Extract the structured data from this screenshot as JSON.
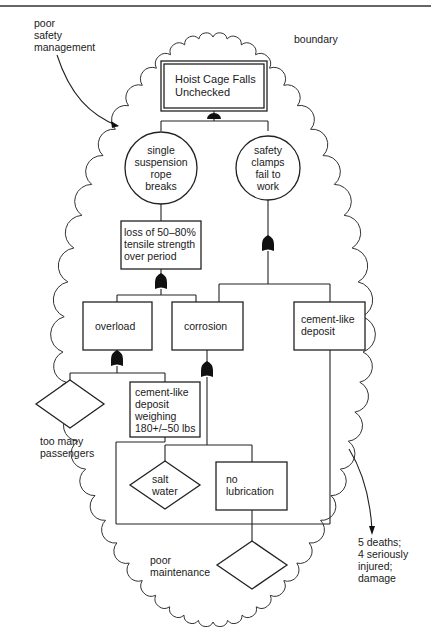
{
  "diagram": {
    "type": "fault-tree",
    "top_border_rule": true,
    "annotations": {
      "poor_safety_management": "poor\nsafety\nmanagement",
      "boundary": "boundary",
      "outcome": "5 deaths;\n4 seriously\ninjured;\ndamage",
      "poor_maintenance": "poor\nmaintenance",
      "too_many_passengers": "too many\npassengers"
    },
    "nodes": {
      "top_event": {
        "label": "Hoist Cage Falls\nUnchecked",
        "shape": "double-rectangle"
      },
      "rope_breaks": {
        "label": "single\nsuspension\nrope\nbreaks",
        "shape": "circle"
      },
      "clamps_fail": {
        "label": "safety\nclamps\nfail to\nwork",
        "shape": "circle"
      },
      "tensile_loss": {
        "label": "loss of 50–80%\ntensile strength\nover period",
        "shape": "rectangle"
      },
      "overload": {
        "label": "overload",
        "shape": "rectangle"
      },
      "corrosion": {
        "label": "corrosion",
        "shape": "rectangle"
      },
      "cement_deposit": {
        "label": "cement-like\ndeposit",
        "shape": "rectangle"
      },
      "cement_weighing": {
        "label": "cement-like\ndeposit\nweighing\n180+/–50 lbs",
        "shape": "rectangle"
      },
      "salt_water": {
        "label": "salt\nwater",
        "shape": "diamond"
      },
      "no_lubrication": {
        "label": "no\nlubrication",
        "shape": "rectangle"
      },
      "passengers_diamond": {
        "label": "",
        "shape": "diamond"
      },
      "maintenance_diamond": {
        "label": "",
        "shape": "diamond"
      }
    },
    "gates": [
      {
        "name": "and-gate-top",
        "type": "AND",
        "feeds": "top_event",
        "inputs": [
          "rope_breaks",
          "clamps_fail"
        ]
      },
      {
        "name": "or-gate-clamps",
        "type": "OR",
        "feeds": "clamps_fail",
        "inputs": [
          "corrosion",
          "cement_deposit"
        ]
      },
      {
        "name": "or-gate-tensile",
        "type": "OR",
        "feeds": "tensile_loss",
        "inputs": [
          "overload",
          "corrosion"
        ]
      },
      {
        "name": "or-gate-overload",
        "type": "OR",
        "feeds": "overload",
        "inputs": [
          "passengers_diamond",
          "cement_weighing"
        ]
      },
      {
        "name": "or-gate-corrosion",
        "type": "OR",
        "feeds": "corrosion",
        "inputs": [
          "salt_water",
          "no_lubrication"
        ]
      }
    ],
    "colors": {
      "line": "#222222",
      "background": "#ffffff",
      "text": "#1a1a1a"
    }
  }
}
